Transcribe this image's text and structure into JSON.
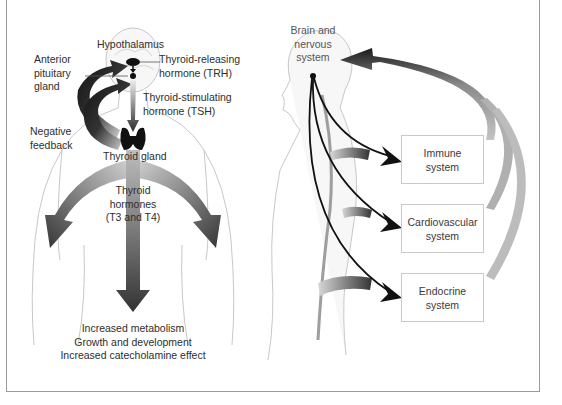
{
  "left_panel": {
    "title": "Hypothalamic-pituitary-thyroid axis",
    "labels": {
      "hypothalamus": "Hypothalamus",
      "anterior_pituitary": [
        "Anterior",
        "pituitary",
        "gland"
      ],
      "trh": [
        "Thyroid-releasing",
        "hormone (TRH)"
      ],
      "tsh": [
        "Thyroid-stimulating",
        "hormone (TSH)"
      ],
      "negative_feedback": [
        "Negative",
        "feedback"
      ],
      "thyroid_gland": "Thyroid gland",
      "thyroid_hormones": [
        "Thyroid",
        "hormones",
        "(T3 and T4)"
      ],
      "effects": [
        "Increased metabolism",
        "Growth and development",
        "Increased catecholamine effect"
      ]
    }
  },
  "right_panel": {
    "labels": {
      "brain": [
        "Brain and",
        "nervous",
        "system"
      ]
    },
    "boxes": [
      {
        "id": "immune",
        "lines": [
          "Immune",
          "system"
        ]
      },
      {
        "id": "cardiovascular",
        "lines": [
          "Cardiovascular",
          "system"
        ]
      },
      {
        "id": "endocrine",
        "lines": [
          "Endocrine",
          "system"
        ]
      }
    ]
  },
  "colors": {
    "frame": "#9a9a9a",
    "arrow_dark": "#1a1a1a",
    "arrow_mid": "#555555",
    "arrow_light": "#b0b0b0",
    "body_outline": "#c4c4c4"
  }
}
